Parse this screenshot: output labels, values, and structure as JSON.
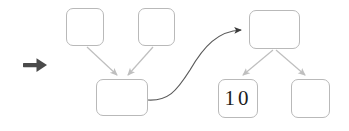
{
  "canvas": {
    "width": 349,
    "height": 131,
    "background_color": "#ffffff"
  },
  "style": {
    "node_border_color": "#b9b9b9",
    "node_fill_color": "#ffffff",
    "light_connector_color": "#bfbfbf",
    "dark_connector_color": "#4d4d4d",
    "step_arrow_color": "#4a4a4a",
    "label_text_color": "#1d1d1d"
  },
  "step_marker": {
    "icon": "right-arrow-icon",
    "label": "→"
  },
  "nodes": [
    {
      "id": "top-left-1",
      "label": "",
      "x": 66,
      "y": 8,
      "w": 38,
      "h": 38
    },
    {
      "id": "top-left-2",
      "label": "",
      "x": 138,
      "y": 8,
      "w": 37,
      "h": 38
    },
    {
      "id": "mid-left",
      "label": "",
      "x": 96,
      "y": 79,
      "w": 52,
      "h": 37
    },
    {
      "id": "top-right",
      "label": "",
      "x": 249,
      "y": 10,
      "w": 51,
      "h": 39
    },
    {
      "id": "bottom-ten",
      "label": "10",
      "x": 218,
      "y": 79,
      "w": 40,
      "h": 39
    },
    {
      "id": "bottom-right",
      "label": "",
      "x": 291,
      "y": 79,
      "w": 39,
      "h": 39
    }
  ],
  "connectors": [
    {
      "id": "edge-top-left-1-to-mid-left",
      "from": "top-left-1",
      "to": "mid-left",
      "kind": "straight",
      "color": "#bfbfbf"
    },
    {
      "id": "edge-top-left-2-to-mid-left",
      "from": "top-left-2",
      "to": "mid-left",
      "kind": "straight",
      "color": "#bfbfbf"
    },
    {
      "id": "edge-mid-left-to-top-right",
      "from": "mid-left",
      "to": "top-right",
      "kind": "curved",
      "color": "#4d4d4d"
    },
    {
      "id": "edge-top-right-to-bottom-ten",
      "from": "top-right",
      "to": "bottom-ten",
      "kind": "straight",
      "color": "#bfbfbf"
    },
    {
      "id": "edge-top-right-to-bottom-right",
      "from": "top-right",
      "to": "bottom-right",
      "kind": "straight",
      "color": "#bfbfbf"
    }
  ],
  "labels": {
    "ten": "10",
    "empty": ""
  }
}
